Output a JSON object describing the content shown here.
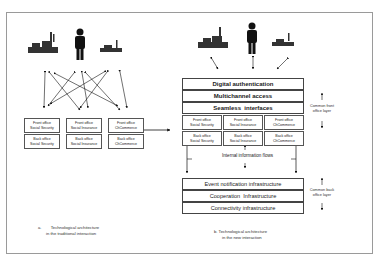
{
  "left": {
    "front_boxes": [
      {
        "line1": "Front office",
        "line2": "Social Security"
      },
      {
        "line1": "Front office",
        "line2": "Social Insurance"
      },
      {
        "line1": "Front office",
        "line2": "ChCommerce"
      }
    ],
    "back_boxes": [
      {
        "line1": "Back office",
        "line2": "Social Security"
      },
      {
        "line1": "Back office",
        "line2": "Social Insurance"
      },
      {
        "line1": "Back office",
        "line2": "ChCommerce"
      }
    ],
    "caption_line1": "a.        Technological architecture",
    "caption_line2": "in the traditional interaction"
  },
  "right": {
    "front_layers": [
      "Digital authentication",
      "Multichannel access",
      "Seamless  interfaces"
    ],
    "front_boxes": [
      {
        "line1": "Front office",
        "line2": "Social Security"
      },
      {
        "line1": "Front office",
        "line2": "Social Insurance"
      },
      {
        "line1": "Front office",
        "line2": "ChCommerce"
      }
    ],
    "back_boxes": [
      {
        "line1": "Back office",
        "line2": "Social Security"
      },
      {
        "line1": "Back office",
        "line2": "Social Insurance"
      },
      {
        "line1": "Back office",
        "line2": "ChCommerce"
      }
    ],
    "internal_flows": "Internal information flows",
    "back_layers": [
      "Event notification infrastructure",
      "Cooperation  Infrastructure",
      "Connectivity infrastructure"
    ],
    "side_front_line1": "Common front",
    "side_front_line2": "office layer",
    "side_back_line1": "Common back",
    "side_back_line2": "office layer",
    "caption_line1": "b. Technological architecture",
    "caption_line2": "in the new interaction"
  },
  "icons": [
    "factory-icon",
    "person-icon",
    "factory-icon"
  ]
}
